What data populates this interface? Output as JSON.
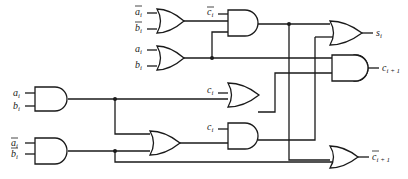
{
  "diagram": {
    "type": "logic-circuit",
    "inputs": {
      "a_bar_i": {
        "base": "a",
        "sub": "i",
        "complement": true
      },
      "b_bar_i": {
        "base": "b",
        "sub": "i",
        "complement": true
      },
      "a_i": {
        "base": "a",
        "sub": "i",
        "complement": false
      },
      "b_i": {
        "base": "b",
        "sub": "i",
        "complement": false
      },
      "c_bar_i": {
        "base": "c",
        "sub": "i",
        "complement": true
      },
      "c_i": {
        "base": "c",
        "sub": "i",
        "complement": false
      }
    },
    "outputs": {
      "s_i": {
        "base": "s",
        "sub": "i",
        "complement": false
      },
      "c_i_plus_1": {
        "base": "c",
        "sub": "i + 1",
        "complement": false
      },
      "c_bar_i_plus_1": {
        "base": "c",
        "sub": "i + 1",
        "complement": true
      }
    },
    "gates": [
      {
        "id": "or1",
        "type": "OR",
        "inputs": [
          "a_bar_i",
          "b_bar_i"
        ]
      },
      {
        "id": "or2",
        "type": "OR",
        "inputs": [
          "a_i",
          "b_i"
        ]
      },
      {
        "id": "and1",
        "type": "AND",
        "inputs": [
          "c_bar_i",
          "or2"
        ]
      },
      {
        "id": "and_ab",
        "type": "AND",
        "inputs": [
          "a_i",
          "b_i"
        ]
      },
      {
        "id": "and_nab",
        "type": "AND",
        "inputs": [
          "a_bar_i",
          "b_bar_i"
        ]
      },
      {
        "id": "or3",
        "type": "OR",
        "inputs": [
          "c_i",
          "and_ab"
        ]
      },
      {
        "id": "or4",
        "type": "OR",
        "inputs": [
          "and_ab",
          "and_nab"
        ]
      },
      {
        "id": "and2",
        "type": "AND",
        "inputs": [
          "c_i",
          "or4"
        ]
      },
      {
        "id": "or_s",
        "type": "OR",
        "inputs": [
          "and1",
          "and2"
        ],
        "output": "s_i"
      },
      {
        "id": "and_c",
        "type": "AND",
        "inputs": [
          "or2",
          "or3"
        ],
        "output": "c_i_plus_1"
      },
      {
        "id": "or_cb",
        "type": "OR",
        "inputs": [
          "and1",
          "and_nab"
        ],
        "output": "c_bar_i_plus_1"
      }
    ]
  },
  "labels": {
    "a": "a",
    "b": "b",
    "c": "c",
    "s": "s",
    "i": "i",
    "i_plus_1": "i + 1"
  }
}
